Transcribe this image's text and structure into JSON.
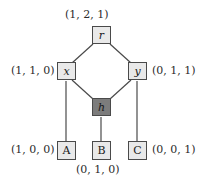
{
  "diagram": {
    "background_color": "#ffffff",
    "node_fill": "#e9e9e9",
    "node_shaded_fill": "#7c7c7c",
    "node_border": "#4a4a4a",
    "edge_color": "#4a4a4a",
    "nodes": [
      {
        "id": "r",
        "label": "r",
        "vector": "(1, 2, 1)",
        "shaded": false,
        "kind": "internal"
      },
      {
        "id": "x",
        "label": "x",
        "vector": "(1, 1, 0)",
        "shaded": false,
        "kind": "internal"
      },
      {
        "id": "y",
        "label": "y",
        "vector": "(0, 1, 1)",
        "shaded": false,
        "kind": "internal"
      },
      {
        "id": "h",
        "label": "h",
        "vector": "",
        "shaded": true,
        "kind": "internal"
      },
      {
        "id": "A",
        "label": "A",
        "vector": "(1, 0, 0)",
        "shaded": false,
        "kind": "leaf"
      },
      {
        "id": "B",
        "label": "B",
        "vector": "(0, 1, 0)",
        "shaded": false,
        "kind": "leaf"
      },
      {
        "id": "C",
        "label": "C",
        "vector": "(0, 0, 1)",
        "shaded": false,
        "kind": "leaf"
      }
    ],
    "edges": [
      {
        "from": "r",
        "to": "x"
      },
      {
        "from": "r",
        "to": "y"
      },
      {
        "from": "x",
        "to": "h"
      },
      {
        "from": "y",
        "to": "h"
      },
      {
        "from": "x",
        "to": "A"
      },
      {
        "from": "h",
        "to": "B"
      },
      {
        "from": "y",
        "to": "C"
      }
    ],
    "labels": {
      "r_vector": "(1, 2, 1)",
      "x_vector": "(1, 1, 0)",
      "y_vector": "(0, 1, 1)",
      "a_vector": "(1, 0, 0)",
      "b_vector": "(0, 1, 0)",
      "c_vector": "(0, 0, 1)"
    },
    "node_labels": {
      "r": "r",
      "x": "x",
      "y": "y",
      "h": "h",
      "a": "A",
      "b": "B",
      "c": "C"
    }
  }
}
